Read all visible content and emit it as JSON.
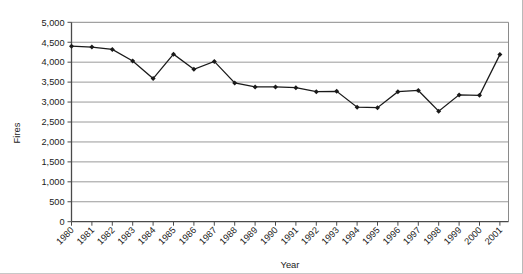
{
  "chart_data": {
    "type": "line",
    "title": "",
    "xlabel": "Year",
    "ylabel": "Fires",
    "categories": [
      "1980",
      "1981",
      "1982",
      "1983",
      "1984",
      "1985",
      "1986",
      "1987",
      "1988",
      "1989",
      "1990",
      "1991",
      "1992",
      "1993",
      "1994",
      "1995",
      "1996",
      "1997",
      "1998",
      "1999",
      "2000",
      "2001"
    ],
    "values": [
      4400,
      4380,
      4320,
      4030,
      3590,
      4200,
      3820,
      4020,
      3480,
      3380,
      3380,
      3360,
      3260,
      3270,
      2870,
      2860,
      3260,
      3290,
      2770,
      3180,
      3170,
      4190
    ],
    "ylim": [
      0,
      5000
    ],
    "ytick_labels": [
      "0",
      "500",
      "1,000",
      "1,500",
      "2,000",
      "2,500",
      "3,000",
      "3,500",
      "4,000",
      "4,500",
      "5,000"
    ],
    "ytick_values": [
      0,
      500,
      1000,
      1500,
      2000,
      2500,
      3000,
      3500,
      4000,
      4500,
      5000
    ],
    "grid": true,
    "grid_axis": "y",
    "legend": false,
    "marker": "diamond",
    "line_color": "#1a1a1a",
    "marker_color": "#1a1a1a",
    "grid_color": "#9a9a9a",
    "axis_color": "#6b6b6b",
    "background_color": "#ffffff"
  },
  "axes": {
    "y_title": "Fires",
    "x_title": "Year"
  }
}
